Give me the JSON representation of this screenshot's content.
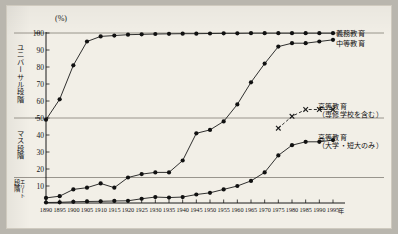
{
  "figure": {
    "unit_label": "(%)",
    "x_axis_unit": "年",
    "stages": [
      {
        "name": "universal",
        "label": "ユニバーサル段階"
      },
      {
        "name": "mass",
        "label": "マス段階"
      },
      {
        "name": "elite",
        "label_a": "段階",
        "label_b": "エリート"
      }
    ]
  },
  "chart_data": {
    "type": "line",
    "title": "",
    "xlabel": "年",
    "ylabel": "(%)",
    "xlim": [
      1890,
      1995
    ],
    "ylim": [
      0,
      100
    ],
    "grid": true,
    "gridlines_y": [
      15,
      50,
      100
    ],
    "legend_position": "right-inline",
    "categories": [
      1890,
      1895,
      1900,
      1905,
      1910,
      1915,
      1920,
      1925,
      1930,
      1935,
      1940,
      1945,
      1950,
      1955,
      1960,
      1965,
      1970,
      1975,
      1980,
      1985,
      1990,
      1995
    ],
    "yticks": [
      10,
      20,
      30,
      40,
      50,
      60,
      70,
      80,
      90,
      100
    ],
    "xticks": [
      1890,
      1895,
      1900,
      1905,
      1910,
      1915,
      1920,
      1925,
      1930,
      1935,
      1940,
      1945,
      1950,
      1955,
      1960,
      1965,
      1970,
      1975,
      1980,
      1985,
      1990,
      1995
    ],
    "series": [
      {
        "name": "compulsory",
        "label": "義務教育",
        "marker": "dot",
        "style": "solid",
        "values": [
          49,
          61,
          81,
          95,
          98,
          98.5,
          99,
          99.2,
          99.4,
          99.5,
          99.6,
          99.6,
          99.7,
          99.8,
          99.8,
          99.9,
          99.9,
          99.9,
          99.9,
          99.9,
          99.9,
          99.9
        ]
      },
      {
        "name": "secondary",
        "label": "中等教育",
        "marker": "dot",
        "style": "solid",
        "values": [
          3,
          4,
          8,
          9,
          11.5,
          9,
          15,
          17,
          18,
          18,
          25,
          41,
          43,
          48,
          58,
          71,
          82,
          92,
          94,
          94,
          95,
          96
        ]
      },
      {
        "name": "higher_with_senshu",
        "label": "高等教育",
        "sublabel": "（専修学校を含む）",
        "marker": "x",
        "style": "dashed",
        "values": [
          null,
          null,
          null,
          null,
          null,
          null,
          null,
          null,
          null,
          null,
          null,
          null,
          null,
          null,
          null,
          null,
          null,
          44,
          51,
          55,
          55,
          55
        ]
      },
      {
        "name": "higher_univ_only",
        "label": "高等教育",
        "sublabel": "（大学・短大のみ）",
        "marker": "dot",
        "style": "solid",
        "values": [
          0.3,
          0.4,
          0.7,
          0.9,
          1.0,
          1.2,
          1.3,
          2.5,
          3.5,
          3.2,
          3.5,
          5,
          6,
          8,
          10,
          13,
          18,
          28,
          34,
          36,
          36,
          37
        ]
      }
    ]
  }
}
